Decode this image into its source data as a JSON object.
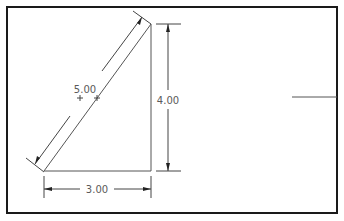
{
  "drawing": {
    "frame_color": "#1a1a1a",
    "geometry_color": "#555555",
    "dimension_color": "#444444",
    "dimensions": {
      "hypotenuse": "5.00",
      "height": "4.00",
      "base": "3.00"
    }
  }
}
